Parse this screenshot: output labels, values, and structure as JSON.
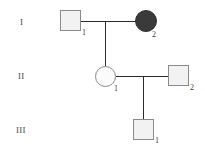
{
  "diagram": {
    "type": "pedigree-chart",
    "title": "",
    "background_color": "#ffffff",
    "line_color": "#2b2b2b",
    "unaffected_fill": "#f2f2f2",
    "affected_fill": "#3a3a3a",
    "symbol_border_color": "#8a8a8a"
  },
  "generations": [
    {
      "label": "I"
    },
    {
      "label": "II"
    },
    {
      "label": "III"
    }
  ],
  "individuals": [
    {
      "id": "I-1",
      "generation": "I",
      "number": "1",
      "shape": "square",
      "sex": "male",
      "affected": false
    },
    {
      "id": "I-2",
      "generation": "I",
      "number": "2",
      "shape": "circle",
      "sex": "female",
      "affected": true
    },
    {
      "id": "II-1",
      "generation": "II",
      "number": "1",
      "shape": "circle",
      "sex": "female",
      "affected": false
    },
    {
      "id": "II-2",
      "generation": "II",
      "number": "2",
      "shape": "square",
      "sex": "male",
      "affected": false
    },
    {
      "id": "III-1",
      "generation": "III",
      "number": "1",
      "shape": "square",
      "sex": "male",
      "affected": false
    }
  ],
  "matings": [
    {
      "id": "mating-1",
      "partners": [
        "I-1",
        "I-2"
      ],
      "children": [
        "II-1"
      ]
    },
    {
      "id": "mating-2",
      "partners": [
        "II-1",
        "II-2"
      ],
      "children": [
        "III-1"
      ]
    }
  ]
}
